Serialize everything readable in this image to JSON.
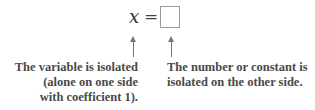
{
  "equation": {
    "variable": "x",
    "sign": "=",
    "box_label": ""
  },
  "annotations": {
    "left": {
      "lines": [
        "The variable is isolated",
        "(alone on one side",
        "with coefficient 1)."
      ]
    },
    "right": {
      "lines": [
        "The number or constant is",
        "isolated on the other side."
      ]
    }
  },
  "colors": {
    "text": "#4a4a4a",
    "arrow": "#777777",
    "box_border": "#9a9a9a"
  }
}
